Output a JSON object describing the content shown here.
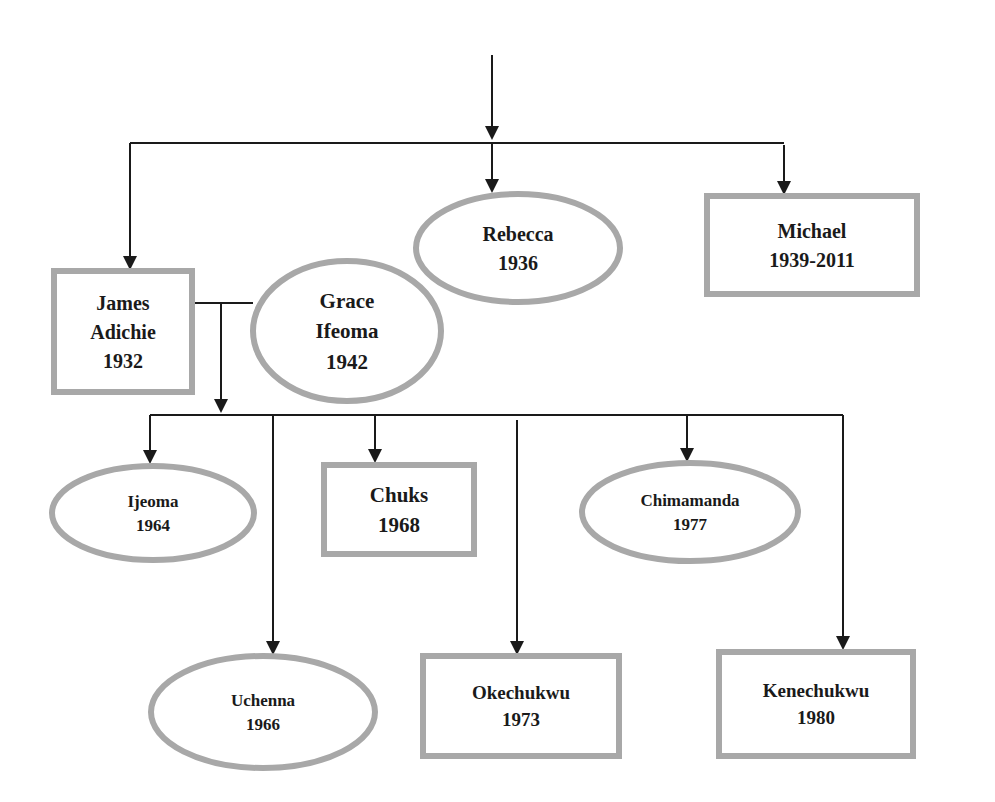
{
  "diagram": {
    "colors": {
      "line": "#1a1a1a",
      "border": "#a8a8a8",
      "text": "#1a1a1a",
      "background": "#ffffff"
    },
    "nodes": [
      {
        "id": "james",
        "shape": "rect",
        "lines": [
          "James",
          "Adichie",
          "1932"
        ],
        "x": 54,
        "y": 271,
        "w": 138,
        "h": 121,
        "font": 20
      },
      {
        "id": "grace",
        "shape": "ellipse",
        "lines": [
          "Grace",
          "Ifeoma",
          "1942"
        ],
        "cx": 347,
        "cy": 331,
        "rx": 94,
        "ry": 70,
        "font": 21
      },
      {
        "id": "rebecca",
        "shape": "ellipse",
        "lines": [
          "Rebecca",
          "1936"
        ],
        "cx": 518,
        "cy": 248,
        "rx": 102,
        "ry": 54,
        "font": 20
      },
      {
        "id": "michael",
        "shape": "rect",
        "lines": [
          "Michael",
          "1939-2011"
        ],
        "x": 707,
        "y": 196,
        "w": 210,
        "h": 98,
        "font": 20
      },
      {
        "id": "ijeoma",
        "shape": "ellipse",
        "lines": [
          "Ijeoma",
          "1964"
        ],
        "cx": 153,
        "cy": 513,
        "rx": 101,
        "ry": 47,
        "font": 17
      },
      {
        "id": "chuks",
        "shape": "rect",
        "lines": [
          "Chuks",
          "1968"
        ],
        "x": 324,
        "y": 465,
        "w": 150,
        "h": 89,
        "font": 21
      },
      {
        "id": "chimamanda",
        "shape": "ellipse",
        "lines": [
          "Chimamanda",
          "1977"
        ],
        "cx": 690,
        "cy": 512,
        "rx": 108,
        "ry": 49,
        "font": 17
      },
      {
        "id": "uchenna",
        "shape": "ellipse",
        "lines": [
          "Uchenna",
          "1966"
        ],
        "cx": 263,
        "cy": 712,
        "rx": 112,
        "ry": 56,
        "font": 17
      },
      {
        "id": "okechukwu",
        "shape": "rect",
        "lines": [
          "Okechukwu",
          "1973"
        ],
        "x": 423,
        "y": 656,
        "w": 196,
        "h": 100,
        "font": 19
      },
      {
        "id": "kenechukwu",
        "shape": "rect",
        "lines": [
          "Kenechukwu",
          "1980"
        ],
        "x": 719,
        "y": 652,
        "w": 194,
        "h": 104,
        "font": 19
      }
    ],
    "edges": [
      {
        "id": "root-drop",
        "points": [
          [
            492,
            55
          ],
          [
            492,
            140
          ]
        ],
        "arrow": true
      },
      {
        "id": "top-bar",
        "points": [
          [
            130,
            143
          ],
          [
            784,
            143
          ]
        ],
        "arrow": false
      },
      {
        "id": "to-james",
        "points": [
          [
            130,
            143
          ],
          [
            130,
            270
          ]
        ],
        "arrow": true
      },
      {
        "id": "to-rebecca",
        "points": [
          [
            492,
            143
          ],
          [
            492,
            193
          ]
        ],
        "arrow": true
      },
      {
        "id": "to-michael",
        "points": [
          [
            784,
            145
          ],
          [
            784,
            195
          ]
        ],
        "arrow": true
      },
      {
        "id": "marriage-line",
        "points": [
          [
            193,
            303
          ],
          [
            253,
            303
          ]
        ],
        "arrow": false
      },
      {
        "id": "couple-drop",
        "points": [
          [
            221,
            303
          ],
          [
            221,
            413
          ]
        ],
        "arrow": true
      },
      {
        "id": "children-bar",
        "points": [
          [
            150,
            415
          ],
          [
            843,
            415
          ]
        ],
        "arrow": false
      },
      {
        "id": "to-ijeoma",
        "points": [
          [
            150,
            415
          ],
          [
            150,
            464
          ]
        ],
        "arrow": true
      },
      {
        "id": "to-uchenna",
        "points": [
          [
            273,
            415
          ],
          [
            273,
            655
          ]
        ],
        "arrow": true
      },
      {
        "id": "to-chuks",
        "points": [
          [
            375,
            415
          ],
          [
            375,
            463
          ]
        ],
        "arrow": true
      },
      {
        "id": "to-okechukwu",
        "points": [
          [
            517,
            420
          ],
          [
            517,
            655
          ]
        ],
        "arrow": true
      },
      {
        "id": "to-chimamanda",
        "points": [
          [
            687,
            415
          ],
          [
            687,
            462
          ]
        ],
        "arrow": true
      },
      {
        "id": "to-kenechukwu",
        "points": [
          [
            843,
            415
          ],
          [
            843,
            650
          ]
        ],
        "arrow": true
      }
    ]
  }
}
